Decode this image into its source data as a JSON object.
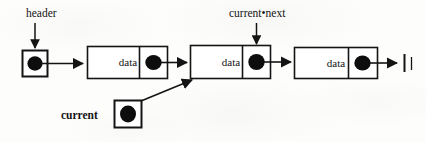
{
  "diagram": {
    "background_color": "#fdfdfc",
    "ink_color": "#141414",
    "labels": {
      "header": "header",
      "current_next": "current•next",
      "current": "current"
    },
    "nodes": [
      {
        "id": "node-1",
        "data_label": "data",
        "pointer": "filled-dot"
      },
      {
        "id": "node-2",
        "data_label": "data",
        "pointer": "filled-dot"
      },
      {
        "id": "node-3",
        "data_label": "data",
        "pointer": "filled-dot"
      }
    ],
    "pointer_boxes": [
      {
        "id": "header-box",
        "label": "header",
        "pointer": "filled-dot"
      },
      {
        "id": "current-box",
        "label": "current",
        "pointer": "filled-dot"
      }
    ],
    "terminator": {
      "id": "null-terminator",
      "symbol": "ground-bars",
      "meaning": "NULL"
    },
    "arrows": [
      {
        "id": "header-label-arrow",
        "from": "header-label",
        "to": "header-box",
        "direction": "down"
      },
      {
        "id": "header-to-node1",
        "from": "header-box",
        "to": "node-1",
        "direction": "right"
      },
      {
        "id": "node1-to-node2",
        "from": "node-1-pointer",
        "to": "node-2",
        "direction": "right"
      },
      {
        "id": "current-next-label-arrow",
        "from": "current-next-label",
        "to": "node-2-pointer",
        "direction": "down"
      },
      {
        "id": "node2-to-node3",
        "from": "node-2-pointer",
        "to": "node-3",
        "direction": "right"
      },
      {
        "id": "node3-to-null",
        "from": "node-3-pointer",
        "to": "null-terminator",
        "direction": "right"
      },
      {
        "id": "current-to-node2",
        "from": "current-box",
        "to": "node-2",
        "direction": "diagonal-up-right"
      }
    ]
  }
}
